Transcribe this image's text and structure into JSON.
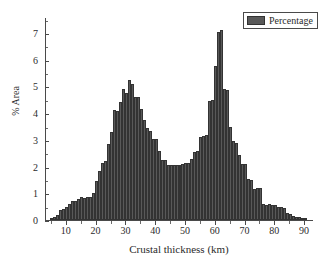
{
  "chart_data": {
    "type": "bar",
    "title": "",
    "xlabel": "Crustal thickness (km)",
    "ylabel": "% Area",
    "xlim": [
      3,
      93
    ],
    "ylim": [
      0,
      7.6
    ],
    "grid": false,
    "legend_position": "top-right",
    "bin_width": 1,
    "series": [
      {
        "name": "Percentage",
        "color": "#595959",
        "edge_color": "#333333",
        "x": [
          5,
          6,
          7,
          8,
          9,
          10,
          11,
          12,
          13,
          14,
          15,
          16,
          17,
          18,
          19,
          20,
          21,
          22,
          23,
          24,
          25,
          26,
          27,
          28,
          29,
          30,
          31,
          32,
          33,
          34,
          35,
          36,
          37,
          38,
          39,
          40,
          41,
          42,
          43,
          44,
          45,
          46,
          47,
          48,
          49,
          50,
          51,
          52,
          53,
          54,
          55,
          56,
          57,
          58,
          59,
          60,
          61,
          62,
          63,
          64,
          65,
          66,
          67,
          68,
          69,
          70,
          71,
          72,
          73,
          74,
          75,
          76,
          77,
          78,
          79,
          80,
          81,
          82,
          83,
          84,
          85,
          86,
          87,
          88,
          89,
          90
        ],
        "values": [
          0.05,
          0.1,
          0.18,
          0.38,
          0.42,
          0.5,
          0.6,
          0.73,
          0.72,
          0.8,
          0.85,
          0.82,
          0.88,
          0.88,
          1.0,
          1.46,
          1.85,
          2.15,
          2.2,
          2.85,
          3.3,
          4.12,
          4.1,
          4.42,
          4.9,
          4.75,
          5.25,
          5.1,
          4.6,
          4.6,
          4.15,
          3.75,
          3.45,
          3.35,
          3.05,
          3.05,
          2.6,
          2.25,
          2.25,
          2.05,
          2.05,
          2.05,
          2.05,
          2.05,
          2.1,
          2.15,
          2.15,
          2.3,
          2.55,
          2.6,
          3.1,
          3.15,
          3.2,
          4.45,
          4.5,
          5.75,
          7.05,
          7.1,
          4.9,
          4.85,
          3.5,
          2.95,
          2.9,
          2.45,
          2.1,
          2.1,
          1.55,
          1.5,
          1.15,
          1.2,
          1.2,
          0.6,
          0.55,
          0.6,
          0.55,
          0.55,
          0.5,
          0.48,
          0.45,
          0.25,
          0.22,
          0.15,
          0.12,
          0.1,
          0.05,
          0.03
        ]
      }
    ],
    "x_ticks": [
      10,
      20,
      30,
      40,
      50,
      60,
      70,
      80,
      90
    ],
    "y_ticks": [
      0,
      1,
      2,
      3,
      4,
      5,
      6,
      7
    ],
    "legend": [
      {
        "label": "Percentage"
      }
    ]
  }
}
